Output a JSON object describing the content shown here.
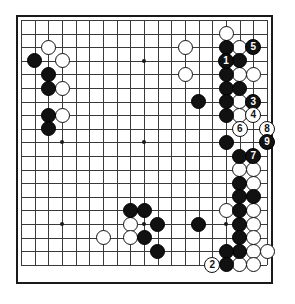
{
  "board": {
    "size": 19,
    "title": "Go board diagram",
    "colors": {
      "black_stone": "#111111",
      "white_stone": "#ffffff",
      "grid_line": "#3a3a3a",
      "border": "#1a1a1a",
      "background": "#ffffff"
    },
    "geometry": {
      "origin_x": 21,
      "origin_y": 20,
      "step_x": 13.67,
      "step_y": 13.6
    },
    "star_points": [
      [
        3,
        3
      ],
      [
        9,
        3
      ],
      [
        15,
        3
      ],
      [
        3,
        9
      ],
      [
        9,
        9
      ],
      [
        15,
        9
      ],
      [
        3,
        15
      ],
      [
        9,
        15
      ],
      [
        15,
        15
      ]
    ],
    "black_stones": [
      [
        1,
        3
      ],
      [
        2,
        4
      ],
      [
        2,
        5
      ],
      [
        2,
        7
      ],
      [
        2,
        8
      ],
      [
        13,
        6
      ],
      [
        15,
        2
      ],
      [
        15,
        4
      ],
      [
        15,
        5
      ],
      [
        15,
        6
      ],
      [
        15,
        7
      ],
      [
        15,
        9
      ],
      [
        16,
        3
      ],
      [
        16,
        5
      ],
      [
        16,
        10
      ],
      [
        16,
        12
      ],
      [
        16,
        13
      ],
      [
        17,
        13
      ],
      [
        16,
        14
      ],
      [
        16,
        15
      ],
      [
        16,
        16
      ],
      [
        16,
        17
      ],
      [
        8,
        14
      ],
      [
        9,
        14
      ],
      [
        10,
        15
      ],
      [
        9,
        16
      ],
      [
        10,
        17
      ],
      [
        13,
        15
      ],
      [
        15,
        17
      ]
    ],
    "white_stones": [
      [
        2,
        2
      ],
      [
        3,
        3
      ],
      [
        3,
        5
      ],
      [
        3,
        7
      ],
      [
        12,
        2
      ],
      [
        12,
        4
      ],
      [
        15,
        1
      ],
      [
        16,
        2
      ],
      [
        17,
        4
      ],
      [
        16,
        4
      ],
      [
        16,
        6
      ],
      [
        16,
        7
      ],
      [
        17,
        11
      ],
      [
        17,
        12
      ],
      [
        15,
        14
      ],
      [
        17,
        14
      ],
      [
        16,
        11
      ],
      [
        17,
        15
      ],
      [
        17,
        16
      ],
      [
        17,
        17
      ],
      [
        8,
        15
      ],
      [
        6,
        16
      ],
      [
        8,
        16
      ],
      [
        16,
        18
      ],
      [
        18,
        17
      ],
      [
        17,
        18
      ]
    ],
    "move_markers": [
      {
        "label": "1",
        "color": "black",
        "col": 15,
        "row": 3,
        "name": "move-1"
      },
      {
        "label": "2",
        "color": "white",
        "col": 14,
        "row": 18,
        "name": "move-2"
      },
      {
        "label": "3",
        "color": "black",
        "col": 17,
        "row": 6,
        "name": "move-3"
      },
      {
        "label": "4",
        "color": "white",
        "col": 17,
        "row": 7,
        "name": "move-4"
      },
      {
        "label": "5",
        "color": "black",
        "col": 17,
        "row": 2,
        "name": "move-5"
      },
      {
        "label": "6",
        "color": "white",
        "col": 16,
        "row": 8,
        "name": "move-6"
      },
      {
        "label": "7",
        "color": "black",
        "col": 17,
        "row": 10,
        "name": "move-7"
      },
      {
        "label": "8",
        "color": "white",
        "col": 18,
        "row": 8,
        "name": "move-8"
      },
      {
        "label": "9",
        "color": "black",
        "col": 18,
        "row": 9,
        "name": "move-9"
      }
    ],
    "edge_stones": [
      {
        "color": "black",
        "col": 15,
        "row": 18,
        "name": "edge-black-bottom"
      }
    ]
  }
}
